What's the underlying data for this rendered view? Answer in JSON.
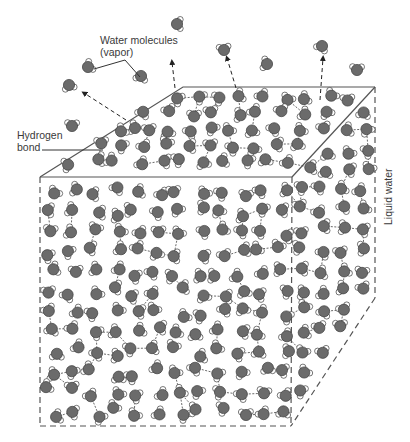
{
  "diagram": {
    "labels": {
      "vapor_line1": "Water molecules",
      "vapor_line2": "(vapor)",
      "hbond_line1": "Hydrogen",
      "hbond_line2": "bond",
      "liquid": "Liquid water"
    },
    "colors": {
      "oxygen": "#6b6b6b",
      "hydrogen": "#ffffff",
      "outline": "#3c3c3c",
      "box_line": "#555555"
    },
    "box": {
      "top_back_left": [
        183,
        87
      ],
      "top_back_right": [
        375,
        87
      ],
      "top_front_left": [
        40,
        177
      ],
      "top_front_right": [
        292,
        177
      ],
      "bottom_front_left": [
        40,
        426
      ],
      "bottom_front_right": [
        291,
        426
      ],
      "right_back_bottom": [
        375,
        298
      ]
    },
    "vapor_molecules": [
      [
        177,
        24
      ],
      [
        88,
        67
      ],
      [
        141,
        76
      ],
      [
        69,
        85
      ],
      [
        224,
        50
      ],
      [
        267,
        64
      ],
      [
        322,
        46
      ],
      [
        357,
        70
      ],
      [
        72,
        126
      ],
      [
        135,
        128
      ]
    ],
    "escape_arrows": [
      [
        [
          126,
          120
        ],
        [
          84,
          93
        ]
      ],
      [
        [
          175,
          88
        ],
        [
          172,
          62
        ]
      ],
      [
        [
          236,
          88
        ],
        [
          227,
          58
        ]
      ],
      [
        [
          320,
          100
        ],
        [
          323,
          58
        ]
      ]
    ]
  }
}
